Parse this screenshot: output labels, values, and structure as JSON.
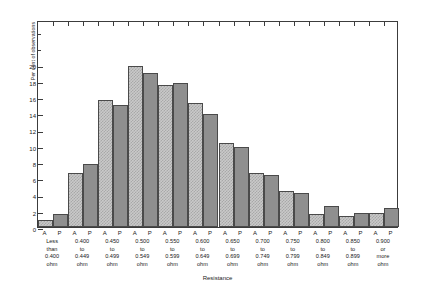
{
  "chart_data": {
    "type": "bar",
    "title": "",
    "xlabel": "Resistance",
    "ylabel": "Per cent of observations",
    "ylim": [
      0,
      25.5
    ],
    "ytick_labels": [
      "0",
      "2",
      "4",
      "6",
      "8",
      "10",
      "12",
      "14",
      "16",
      "18",
      "20"
    ],
    "ytick_values": [
      0,
      2,
      4,
      6,
      8,
      10,
      12,
      14,
      16,
      18,
      20
    ],
    "grid": false,
    "legend_position": "none",
    "series_tick_labels": [
      "A",
      "P"
    ],
    "categories": [
      "Less than 0.400 ohm",
      "0.400 to 0.449 ohm",
      "0.450 to 0.499 ohm",
      "0.500 to 0.549 ohm",
      "0.550 to 0.599 ohm",
      "0.600 to 0.649 ohm",
      "0.650 to 0.699 ohm",
      "0.700 to 0.749 ohm",
      "0.750 to 0.799 ohm",
      "0.800 to 0.849 ohm",
      "0.850 to 0.899 ohm",
      "0.900 or more ohm"
    ],
    "category_lines": [
      [
        "Less",
        "than",
        "0.400",
        "ohm"
      ],
      [
        "0.400",
        "to",
        "0.449",
        "ohm"
      ],
      [
        "0.450",
        "to",
        "0.499",
        "ohm"
      ],
      [
        "0.500",
        "to",
        "0.549",
        "ohm"
      ],
      [
        "0.550",
        "to",
        "0.599",
        "ohm"
      ],
      [
        "0.600",
        "to",
        "0.649",
        "ohm"
      ],
      [
        "0.650",
        "to",
        "0.699",
        "ohm"
      ],
      [
        "0.700",
        "to",
        "0.749",
        "ohm"
      ],
      [
        "0.750",
        "to",
        "0.799",
        "ohm"
      ],
      [
        "0.800",
        "to",
        "0.849",
        "ohm"
      ],
      [
        "0.850",
        "to",
        "0.899",
        "ohm"
      ],
      [
        "0.900",
        "or",
        "more",
        "ohm"
      ]
    ],
    "series": [
      {
        "name": "A",
        "values": [
          0.9,
          6.6,
          15.7,
          19.8,
          17.5,
          15.3,
          10.3,
          6.6,
          4.4,
          1.6,
          1.4,
          1.7
        ]
      },
      {
        "name": "P",
        "values": [
          1.6,
          7.8,
          15.0,
          19.0,
          17.7,
          13.9,
          9.8,
          6.4,
          4.2,
          2.6,
          1.7,
          2.3
        ]
      }
    ],
    "colors": {
      "series_a_fill": "#c9c9c9",
      "series_a_hatch": "#a8a8a8",
      "series_p_fill": "#8f8f8f",
      "bar_edge": "#4a4a4a",
      "axis": "#3c3c3c",
      "background": "#ffffff",
      "text": "#1a1a1a"
    }
  }
}
